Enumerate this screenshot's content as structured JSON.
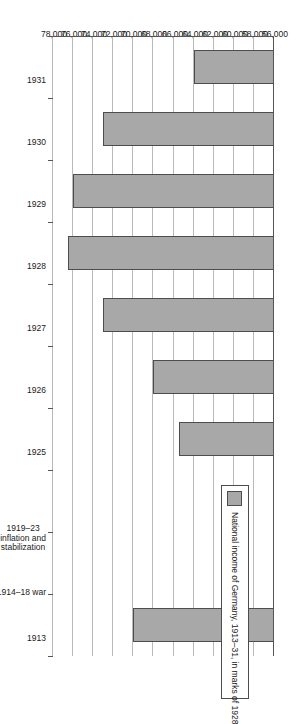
{
  "chart_data": {
    "type": "bar",
    "orientation": "horizontal",
    "title": "",
    "xlabel": "",
    "ylabel": "",
    "legend": [
      {
        "label": "National income of Germany, 1913–31, in marks of 1928",
        "color": "#a8a8a8"
      }
    ],
    "legend_position": "inside-left",
    "grid": true,
    "value_axis": {
      "min": 56000,
      "max": 78000,
      "step": 2000,
      "ticks": [
        "78,000",
        "76,000",
        "74,000",
        "72,000",
        "70,000",
        "68,000",
        "66,000",
        "64,000",
        "62,000",
        "60,000",
        "58,000",
        "56,000"
      ],
      "tick_values": [
        78000,
        76000,
        74000,
        72000,
        70000,
        68000,
        66000,
        64000,
        62000,
        60000,
        58000,
        56000
      ]
    },
    "categories": [
      "1913",
      "1914–18 war",
      "1919–23 inflation and stabilization",
      "1925",
      "1926",
      "1927",
      "1928",
      "1929",
      "1930",
      "1931"
    ],
    "category_labels": [
      {
        "lines": [
          "1913"
        ]
      },
      {
        "lines": [
          "1914–18 war"
        ]
      },
      {
        "lines": [
          "1919–23",
          "inflation and",
          "stabilization"
        ]
      },
      {
        "lines": [
          "1925"
        ]
      },
      {
        "lines": [
          "1926"
        ]
      },
      {
        "lines": [
          "1927"
        ]
      },
      {
        "lines": [
          "1928"
        ]
      },
      {
        "lines": [
          "1929"
        ]
      },
      {
        "lines": [
          "1930"
        ]
      },
      {
        "lines": [
          "1931"
        ]
      }
    ],
    "values": [
      70000,
      null,
      null,
      65500,
      68000,
      73000,
      76500,
      76000,
      73000,
      64000
    ],
    "colors": {
      "bar_fill": "#a8a8a8",
      "bar_stroke": "#4d4d4d",
      "gridline": "#b9b9b9",
      "axis": "#555555",
      "text": "#1a1a1a",
      "background": "#ffffff"
    }
  }
}
